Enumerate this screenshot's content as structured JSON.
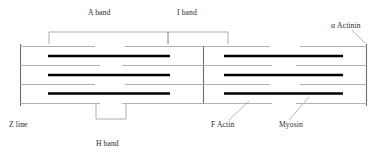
{
  "figure": {
    "width": 380,
    "height": 158,
    "background_color": "#ffffff",
    "line_color_thin": "#8c8c8c",
    "line_color_thick": "#000000",
    "bracket_color": "#8c8c8c",
    "leader_color": "#8c8c8c",
    "text_color": "#2b2b2b"
  },
  "labels": {
    "a_band": "A band",
    "i_band": "I band",
    "h_band": "H band",
    "z_line": "Z line",
    "alpha_actinin": "α Actinin",
    "f_actin": "F Actin",
    "myosin": "Myosin"
  },
  "structure": {
    "z_lines": [
      {
        "name": "left-z-line",
        "x": 20,
        "y_top": 44,
        "y_bottom": 106
      },
      {
        "name": "middle-z-line",
        "x": 203,
        "y_top": 46,
        "y_bottom": 104
      },
      {
        "name": "right-z-line",
        "x": 367,
        "y_top": 44,
        "y_bottom": 106
      }
    ],
    "actin_filaments": [
      {
        "y": 46,
        "segments": [
          [
            20,
            95
          ],
          [
            125,
            203
          ],
          [
            203,
            270
          ],
          [
            300,
            367
          ]
        ]
      },
      {
        "y": 65,
        "segments": [
          [
            20,
            100
          ],
          [
            122,
            203
          ],
          [
            203,
            272
          ],
          [
            296,
            367
          ]
        ]
      },
      {
        "y": 84,
        "segments": [
          [
            20,
            95
          ],
          [
            125,
            203
          ],
          [
            203,
            270
          ],
          [
            300,
            367
          ]
        ]
      },
      {
        "y": 102,
        "segments": [
          [
            20,
            100
          ],
          [
            122,
            203
          ],
          [
            203,
            272
          ],
          [
            296,
            367
          ]
        ]
      }
    ],
    "myosin_filaments": [
      {
        "y": 56,
        "x1": 48,
        "x2": 170
      },
      {
        "y": 56,
        "x1": 223,
        "x2": 343
      },
      {
        "y": 75,
        "x1": 48,
        "x2": 170
      },
      {
        "y": 75,
        "x1": 223,
        "x2": 343
      },
      {
        "y": 93,
        "x1": 48,
        "x2": 170
      },
      {
        "y": 93,
        "x1": 223,
        "x2": 343
      }
    ],
    "a_band_bracket": {
      "x1": 49,
      "x2": 168,
      "y_bar": 32,
      "leg_bottom": 44
    },
    "i_band_bracket": {
      "x1": 168,
      "x2": 228,
      "y_bar": 32,
      "leg_bottom": 44
    },
    "h_band_bracket": {
      "x1": 96,
      "x2": 126,
      "y_bar": 119,
      "leg_top": 104
    },
    "leaders": [
      {
        "name": "alpha-actinin-leader",
        "x1": 355,
        "y1": 30,
        "x2": 367,
        "y2": 44
      },
      {
        "name": "f-actin-leader",
        "x1": 228,
        "y1": 122,
        "x2": 248,
        "y2": 101
      },
      {
        "name": "myosin-leader",
        "x1": 288,
        "y1": 122,
        "x2": 308,
        "y2": 98
      }
    ]
  },
  "label_positions": {
    "a_band": {
      "x": 88,
      "y": 10
    },
    "i_band": {
      "x": 176,
      "y": 10
    },
    "alpha_actinin": {
      "x": 330,
      "y": 25
    },
    "z_line": {
      "x": 9,
      "y": 124
    },
    "h_band": {
      "x": 96,
      "y": 139
    },
    "f_actin": {
      "x": 211,
      "y": 124
    },
    "myosin": {
      "x": 280,
      "y": 124
    }
  }
}
